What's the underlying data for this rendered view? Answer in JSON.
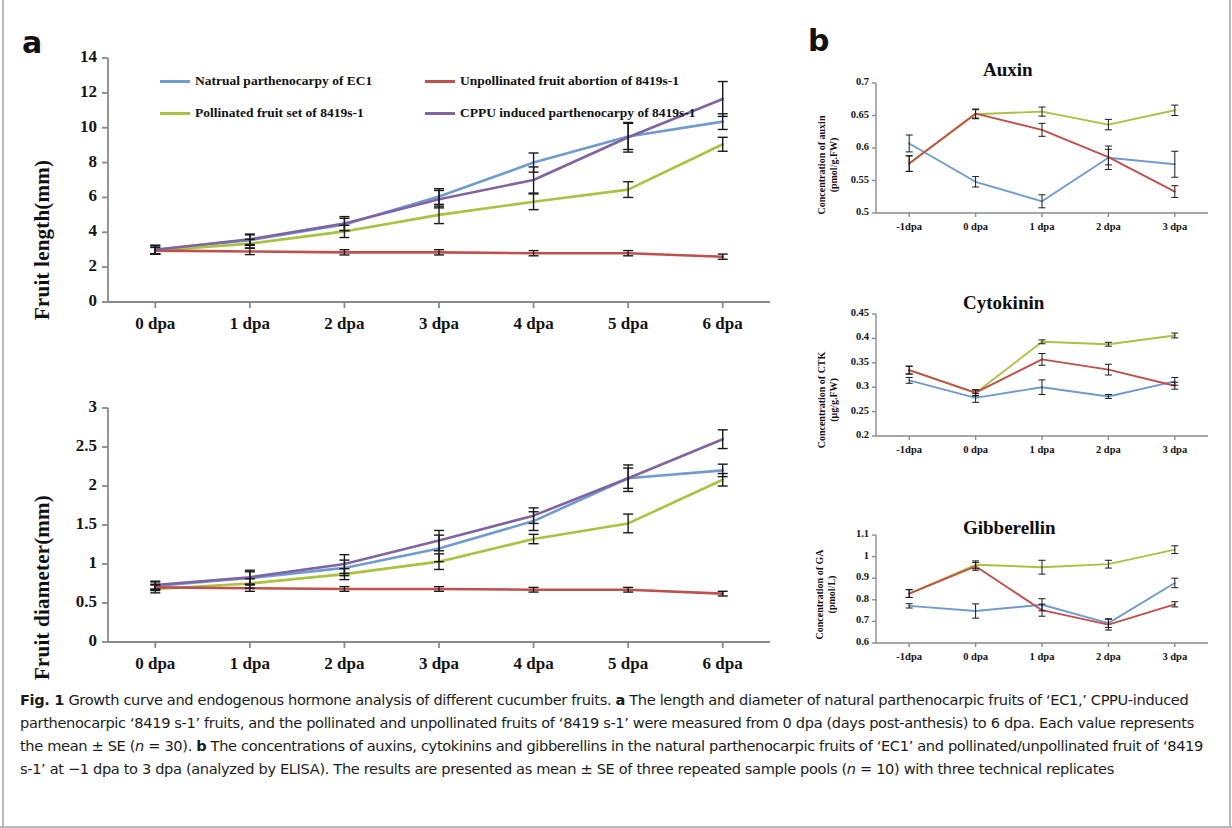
{
  "figure": {
    "panel_a_letter": "a",
    "panel_b_letter": "b",
    "caption_fig_label": "Fig. 1",
    "caption_text": " Growth curve and endogenous hormone analysis of different cucumber fruits. ",
    "caption_a_letter": "a",
    "caption_a_text": " The length and diameter of natural parthenocarpic fruits of ‘EC1,’ CPPU-induced parthenocarpic ‘8419 s-1’ fruits, and the pollinated and unpollinated fruits of ‘8419 s-1’ were measured from 0 dpa (days post-anthesis) to 6 dpa. Each value represents the mean ± SE (",
    "caption_n1_italic": "n",
    "caption_n1_value": " = 30). ",
    "caption_b_letter": "b",
    "caption_b_text": " The concentrations of auxins, cytokinins and gibberellins in the natural parthenocarpic fruits of ‘EC1’ and pollinated/unpollinated fruit of ‘8419 s-1’ at −1 dpa to 3 dpa (analyzed by ELISA). The results are presented as mean ± SE of three repeated sample pools (",
    "caption_n2_italic": "n",
    "caption_n2_value": " = 10) with three technical replicates"
  },
  "colors": {
    "natural_ec1": "#6E9BD1",
    "pollinated_8419": "#A9C23F",
    "unpollinated_8419": "#C0504D",
    "cppu_8419": "#8064A2",
    "axis": "#8a8a8a",
    "error_bar": "#1a1a1a"
  },
  "legend": {
    "items": [
      {
        "label": "Natrual parthenocarpy of EC1",
        "color_key": "natural_ec1"
      },
      {
        "label": "Unpollinated fruit abortion of 8419s-1",
        "color_key": "unpollinated_8419"
      },
      {
        "label": "Pollinated fruit set of 8419s-1",
        "color_key": "pollinated_8419"
      },
      {
        "label": "CPPU induced parthenocarpy of 8419s-1",
        "color_key": "cppu_8419"
      }
    ]
  },
  "chart_data": [
    {
      "id": "fruit-length",
      "type": "line",
      "title": "",
      "ylabel": "Fruit length(mm)",
      "xlabel": "",
      "categories": [
        "0 dpa",
        "1 dpa",
        "2 dpa",
        "3 dpa",
        "4 dpa",
        "5 dpa",
        "6 dpa"
      ],
      "ylim": [
        0,
        14
      ],
      "yticks": [
        0,
        2,
        4,
        6,
        8,
        10,
        12,
        14
      ],
      "ytick_labels": [
        "0",
        "2",
        "4",
        "6",
        "8",
        "10",
        "12",
        "14"
      ],
      "grid": false,
      "legend_position": "top-inside",
      "series": [
        {
          "name": "Natrual parthenocarpy of EC1",
          "color_key": "natural_ec1",
          "values": [
            3.0,
            3.55,
            4.45,
            6.05,
            8.0,
            9.5,
            10.35
          ],
          "errors": [
            0.25,
            0.3,
            0.35,
            0.45,
            0.55,
            0.75,
            0.45
          ]
        },
        {
          "name": "Pollinated fruit set of 8419s-1",
          "color_key": "pollinated_8419",
          "values": [
            2.95,
            3.35,
            4.05,
            5.0,
            5.75,
            6.45,
            9.05
          ],
          "errors": [
            0.2,
            0.25,
            0.35,
            0.5,
            0.45,
            0.45,
            0.4
          ]
        },
        {
          "name": "Unpollinated fruit abortion of 8419s-1",
          "color_key": "unpollinated_8419",
          "values": [
            2.95,
            2.9,
            2.85,
            2.85,
            2.8,
            2.8,
            2.6
          ],
          "errors": [
            0.18,
            0.18,
            0.15,
            0.15,
            0.15,
            0.15,
            0.15
          ]
        },
        {
          "name": "CPPU induced parthenocarpy of 8419s-1",
          "color_key": "cppu_8419",
          "values": [
            3.0,
            3.6,
            4.5,
            5.9,
            7.0,
            9.45,
            11.65
          ],
          "errors": [
            0.25,
            0.3,
            0.4,
            0.5,
            0.75,
            0.85,
            1.0
          ]
        }
      ]
    },
    {
      "id": "fruit-diameter",
      "type": "line",
      "title": "",
      "ylabel": "Fruit diameter(mm)",
      "xlabel": "",
      "categories": [
        "0 dpa",
        "1 dpa",
        "2 dpa",
        "3 dpa",
        "4 dpa",
        "5 dpa",
        "6 dpa"
      ],
      "ylim": [
        0,
        3
      ],
      "yticks": [
        0,
        0.5,
        1,
        1.5,
        2,
        2.5,
        3
      ],
      "ytick_labels": [
        "0",
        "0.5",
        "1",
        "1.5",
        "2",
        "2.5",
        "3"
      ],
      "grid": false,
      "legend_position": "none",
      "series": [
        {
          "name": "Natrual parthenocarpy of EC1",
          "color_key": "natural_ec1",
          "values": [
            0.72,
            0.82,
            0.95,
            1.2,
            1.55,
            2.1,
            2.2
          ],
          "errors": [
            0.05,
            0.08,
            0.1,
            0.17,
            0.12,
            0.17,
            0.08
          ]
        },
        {
          "name": "Pollinated fruit set of 8419s-1",
          "color_key": "pollinated_8419",
          "values": [
            0.68,
            0.75,
            0.87,
            1.03,
            1.32,
            1.52,
            2.08
          ],
          "errors": [
            0.05,
            0.06,
            0.07,
            0.1,
            0.06,
            0.12,
            0.08
          ]
        },
        {
          "name": "Unpollinated fruit abortion of 8419s-1",
          "color_key": "unpollinated_8419",
          "values": [
            0.7,
            0.69,
            0.68,
            0.68,
            0.67,
            0.67,
            0.62
          ],
          "errors": [
            0.04,
            0.04,
            0.03,
            0.03,
            0.03,
            0.03,
            0.03
          ]
        },
        {
          "name": "CPPU induced parthenocarpy of 8419s-1",
          "color_key": "cppu_8419",
          "values": [
            0.73,
            0.83,
            1.0,
            1.3,
            1.62,
            2.1,
            2.6
          ],
          "errors": [
            0.05,
            0.09,
            0.12,
            0.13,
            0.1,
            0.13,
            0.12
          ]
        }
      ]
    },
    {
      "id": "auxin",
      "type": "line",
      "title": "Auxin",
      "ylabel": "Concentration of auxin\n(pmol/g.FW)",
      "ylabel_line1": "Concentration of auxin",
      "ylabel_line2": "(pmol/g.FW)",
      "xlabel": "",
      "categories": [
        "-1dpa",
        "0 dpa",
        "1 dpa",
        "2 dpa",
        "3 dpa"
      ],
      "ylim": [
        0.5,
        0.7
      ],
      "yticks": [
        0.5,
        0.55,
        0.6,
        0.65,
        0.7
      ],
      "ytick_labels": [
        "0.5",
        "0.55",
        "0.6",
        "0.65",
        "0.7"
      ],
      "grid": false,
      "legend_position": "none",
      "series": [
        {
          "name": "Natrual parthenocarpy of EC1",
          "color_key": "natural_ec1",
          "values": [
            0.607,
            0.548,
            0.518,
            0.585,
            0.575
          ],
          "errors": [
            0.013,
            0.008,
            0.01,
            0.018,
            0.02
          ]
        },
        {
          "name": "Pollinated fruit set of 8419s-1",
          "color_key": "pollinated_8419",
          "values": [
            0.576,
            0.652,
            0.656,
            0.636,
            0.658
          ],
          "errors": [
            0.012,
            0.007,
            0.007,
            0.008,
            0.008
          ]
        },
        {
          "name": "Unpollinated fruit abortion of 8419s-1",
          "color_key": "unpollinated_8419",
          "values": [
            0.576,
            0.653,
            0.628,
            0.586,
            0.533
          ],
          "errors": [
            0.012,
            0.007,
            0.01,
            0.012,
            0.009
          ]
        }
      ]
    },
    {
      "id": "cytokinin",
      "type": "line",
      "title": "Cytokinin",
      "ylabel": "Concentration of CTK\n(μg/g.FW)",
      "ylabel_line1": "Concentration of CTK",
      "ylabel_line2": "(μg/g.FW)",
      "xlabel": "",
      "categories": [
        "-1dpa",
        "0 dpa",
        "1 dpa",
        "2 dpa",
        "3 dpa"
      ],
      "ylim": [
        0.2,
        0.45
      ],
      "yticks": [
        0.2,
        0.25,
        0.3,
        0.35,
        0.4,
        0.45
      ],
      "ytick_labels": [
        "0.2",
        "0.25",
        "0.3",
        "0.35",
        "0.4",
        "0.45"
      ],
      "grid": false,
      "legend_position": "none",
      "series": [
        {
          "name": "Natrual parthenocarpy of EC1",
          "color_key": "natural_ec1",
          "values": [
            0.314,
            0.278,
            0.3,
            0.281,
            0.312
          ],
          "errors": [
            0.006,
            0.009,
            0.015,
            0.004,
            0.008
          ]
        },
        {
          "name": "Pollinated fruit set of 8419s-1",
          "color_key": "pollinated_8419",
          "values": [
            0.335,
            0.288,
            0.393,
            0.388,
            0.406
          ],
          "errors": [
            0.008,
            0.006,
            0.004,
            0.004,
            0.005
          ]
        },
        {
          "name": "Unpollinated fruit abortion of 8419s-1",
          "color_key": "unpollinated_8419",
          "values": [
            0.335,
            0.289,
            0.357,
            0.336,
            0.303
          ],
          "errors": [
            0.008,
            0.006,
            0.012,
            0.011,
            0.007
          ]
        }
      ]
    },
    {
      "id": "gibberellin",
      "type": "line",
      "title": "Gibberellin",
      "ylabel": "Concentration of GA\n(pmol/L)",
      "ylabel_line1": "Concentration of GA",
      "ylabel_line2": "(pmol/L)",
      "xlabel": "",
      "categories": [
        "-1dpa",
        "0 dpa",
        "1 dpa",
        "2 dpa",
        "3 dpa"
      ],
      "ylim": [
        0.6,
        1.1
      ],
      "yticks": [
        0.6,
        0.7,
        0.8,
        0.9,
        1.0,
        1.1
      ],
      "ytick_labels": [
        "0.6",
        "0.7",
        "0.8",
        "0.9",
        "1",
        "1.1"
      ],
      "grid": false,
      "legend_position": "none",
      "series": [
        {
          "name": "Natrual parthenocarpy of EC1",
          "color_key": "natural_ec1",
          "values": [
            0.772,
            0.748,
            0.777,
            0.692,
            0.878
          ],
          "errors": [
            0.01,
            0.033,
            0.028,
            0.02,
            0.022
          ]
        },
        {
          "name": "Pollinated fruit set of 8419s-1",
          "color_key": "pollinated_8419",
          "values": [
            0.829,
            0.962,
            0.951,
            0.965,
            1.032
          ],
          "errors": [
            0.018,
            0.018,
            0.032,
            0.018,
            0.018
          ]
        },
        {
          "name": "Unpollinated fruit abortion of 8419s-1",
          "color_key": "unpollinated_8419",
          "values": [
            0.829,
            0.955,
            0.752,
            0.685,
            0.779
          ],
          "errors": [
            0.018,
            0.018,
            0.028,
            0.025,
            0.012
          ]
        }
      ]
    }
  ]
}
